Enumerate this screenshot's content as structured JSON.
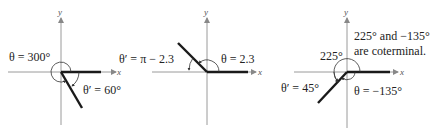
{
  "panels": [
    {
      "name": "panel-300-degrees",
      "axis_x": "x",
      "axis_y": "y",
      "theta_label": "θ = 300°",
      "ref_label": "θ′ = 60°"
    },
    {
      "name": "panel-2-3-radians",
      "axis_x": "x",
      "axis_y": "y",
      "theta_label": "θ = 2.3",
      "ref_label": "θ′ = π − 2.3"
    },
    {
      "name": "panel-negative-135-degrees",
      "axis_x": "x",
      "axis_y": "y",
      "theta_label": "θ = −135°",
      "ref_label": "θ′ = 45°",
      "angle_label": "225°",
      "note_line1": "225° and −135°",
      "note_line2": "are coterminal."
    }
  ],
  "colors": {
    "axis": "#9a9a9a",
    "ray": "#1a1a1a",
    "text": "#222222"
  }
}
